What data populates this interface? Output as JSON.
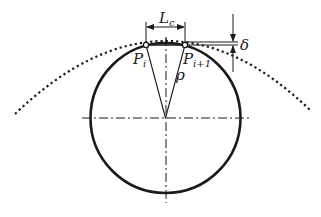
{
  "diagram": {
    "type": "geometry-illustration",
    "colors": {
      "stroke": "#1a1a1a",
      "background": "#ffffff"
    },
    "labels": {
      "chord_length": {
        "main": "L",
        "sub": "c"
      },
      "point_left": {
        "main": "P",
        "sub": "i"
      },
      "point_right": {
        "main": "P",
        "sub": "i+1"
      },
      "radius": {
        "main": "ρ"
      },
      "error": {
        "main": "δ"
      }
    },
    "geometry": {
      "circle": {
        "cx": 165.5,
        "cy": 118,
        "r": 75
      },
      "dotted_curve": {
        "start": [
          15,
          114
        ],
        "apex": [
          165,
          41
        ],
        "end": [
          310,
          110
        ]
      },
      "point_left": [
        146,
        45
      ],
      "point_right": [
        185,
        45
      ]
    }
  }
}
